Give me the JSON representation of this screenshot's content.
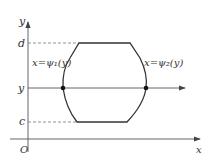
{
  "diagram": {
    "axes": {
      "y_label": "y",
      "x_label": "x",
      "origin_label": "O"
    },
    "levels": {
      "top": "d",
      "middle": "y",
      "bottom": "c"
    },
    "curves": {
      "left": "x=ψ₁(y)",
      "right": "x=ψ₂(y)"
    },
    "colors": {
      "line": "#333333",
      "dashed": "#777777",
      "axis": "#555555"
    }
  }
}
